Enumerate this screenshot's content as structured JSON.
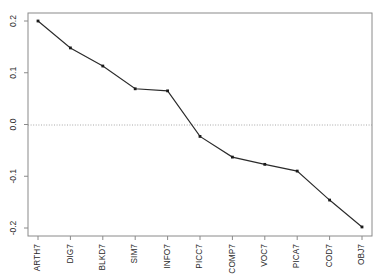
{
  "chart_data": {
    "type": "line",
    "title": "",
    "subtitle": "",
    "xlabel": "",
    "ylabel": "",
    "categories": [
      "ARTH7",
      "DIG7",
      "BLKD7",
      "SIM7",
      "INFO7",
      "PICC7",
      "COMP7",
      "VOC7",
      "PICA7",
      "COD7",
      "OBJ7"
    ],
    "values": [
      0.2,
      0.148,
      0.113,
      0.069,
      0.065,
      -0.023,
      -0.063,
      -0.077,
      -0.09,
      -0.146,
      -0.198
    ],
    "series": [
      {
        "name": "",
        "values": [
          0.2,
          0.148,
          0.113,
          0.069,
          0.065,
          -0.023,
          -0.063,
          -0.077,
          -0.09,
          -0.146,
          -0.198
        ]
      }
    ],
    "ylim": [
      -0.2,
      0.2
    ],
    "yticks": [
      0.2,
      0.1,
      0.0,
      -0.1,
      -0.2
    ],
    "ytick_labels": [
      "0.2",
      "0.1",
      "0.0",
      "-0.1",
      "-0.2"
    ],
    "xtick_labels": [
      "ARTH7",
      "DIG7",
      "BLKD7",
      "SIM7",
      "INFO7",
      "PICC7",
      "COMP7",
      "VOC7",
      "PICA7",
      "COD7",
      "OBJ7"
    ],
    "grid": false,
    "reference_line": 0.0,
    "legend": [],
    "legend_position": "none",
    "annotations": [],
    "marker": "point",
    "line_color": "#2b2b2b",
    "marker_color": "#1a1a1a",
    "axis_color": "#8a8a8a",
    "reference_line_color": "#a8a8a8",
    "background_color": "#ffffff"
  }
}
